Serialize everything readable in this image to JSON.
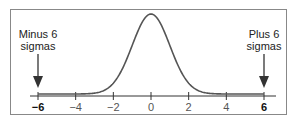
{
  "chart_data": {
    "type": "line",
    "title": "",
    "xlabel": "",
    "ylabel": "",
    "xlim": [
      -6,
      6
    ],
    "grid": false,
    "legend": null,
    "x_ticks": [
      -6,
      -4,
      -2,
      0,
      2,
      4,
      6
    ],
    "x_tick_labels": [
      "−6",
      "−4",
      "−2",
      "0",
      "2",
      "4",
      "6"
    ],
    "bold_tick_labels": [
      "−6",
      "6"
    ],
    "series": [
      {
        "name": "Normal distribution",
        "function": "standard normal pdf",
        "x": [
          -6,
          -5,
          -4,
          -3,
          -2.5,
          -2,
          -1.5,
          -1,
          -0.5,
          0,
          0.5,
          1,
          1.5,
          2,
          2.5,
          3,
          4,
          5,
          6
        ],
        "values": [
          0.0,
          0.0,
          0.0001,
          0.0044,
          0.0175,
          0.054,
          0.1295,
          0.242,
          0.3521,
          0.3989,
          0.3521,
          0.242,
          0.1295,
          0.054,
          0.0175,
          0.0044,
          0.0001,
          0.0,
          0.0
        ]
      }
    ],
    "annotations": [
      {
        "text_lines": [
          "Minus 6",
          "sigmas"
        ],
        "x": -6,
        "arrow": "down"
      },
      {
        "text_lines": [
          "Plus 6",
          "sigmas"
        ],
        "x": 6,
        "arrow": "down"
      }
    ]
  },
  "annotations": {
    "left": {
      "line1": "Minus 6",
      "line2": "sigmas"
    },
    "right": {
      "line1": "Plus 6",
      "line2": "sigmas"
    }
  },
  "axis": {
    "ticks": [
      "−6",
      "−4",
      "−2",
      "0",
      "2",
      "4",
      "6"
    ]
  },
  "colors": {
    "curve": "#555555",
    "frame": "#888888",
    "axis": "#333333",
    "arrow": "#333333",
    "tail_band": "#777777"
  }
}
